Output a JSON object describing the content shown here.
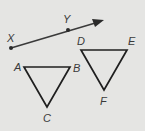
{
  "figure": {
    "background": "#e5e5e3",
    "stroke_color": "#2a2a2a",
    "ray": {
      "start_label": "X",
      "through_label": "Y",
      "points": {
        "X": [
          11,
          48
        ],
        "Y": [
          68,
          29
        ],
        "tip": [
          104,
          20
        ]
      }
    },
    "triangle_abc": {
      "labels": {
        "A": "A",
        "B": "B",
        "C": "C"
      },
      "points": {
        "A": [
          24,
          67
        ],
        "B": [
          70,
          67
        ],
        "C": [
          47,
          107
        ]
      }
    },
    "triangle_def": {
      "labels": {
        "D": "D",
        "E": "E",
        "F": "F"
      },
      "points": {
        "D": [
          81,
          50
        ],
        "E": [
          127,
          50
        ],
        "F": [
          104,
          90
        ]
      }
    }
  }
}
